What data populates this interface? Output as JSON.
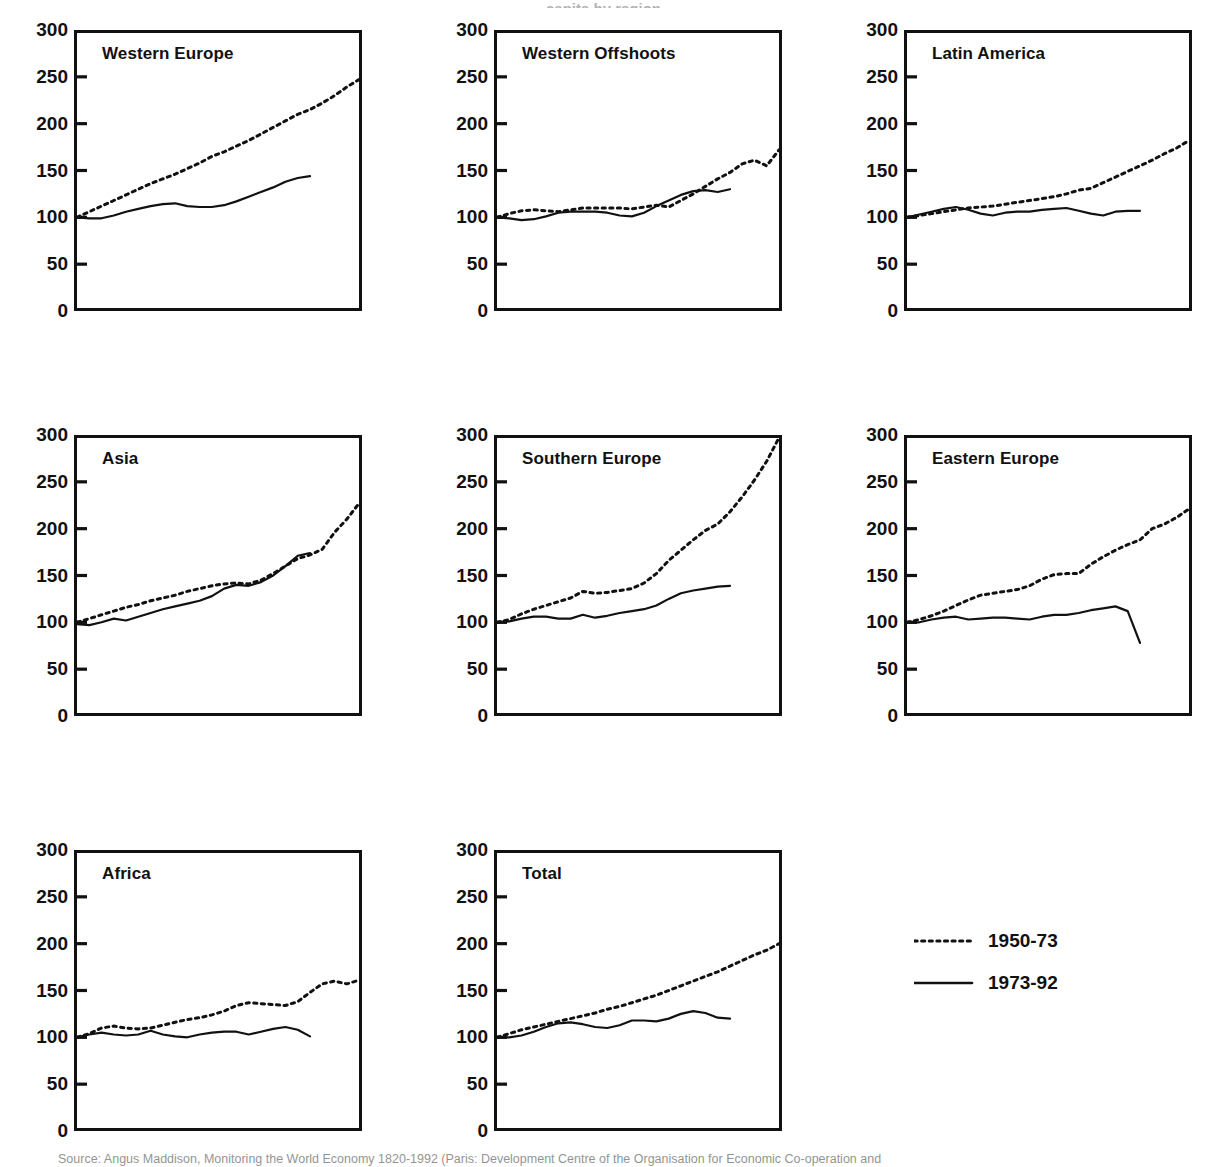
{
  "figure": {
    "top_title": "capita by region",
    "source": "Source: Angus Maddison, Monitoring the World Economy 1820-1992 (Paris: Development Centre of the Organisation for Economic Co-operation and"
  },
  "axis": {
    "yticks": [
      300,
      250,
      200,
      150,
      100,
      50,
      0
    ],
    "ymin": 0,
    "ymax": 300
  },
  "legend": {
    "position": "bottom-right",
    "entries": [
      {
        "label": "1950-73",
        "style": "dotted"
      },
      {
        "label": "1973-92",
        "style": "solid"
      }
    ]
  },
  "chart_data": {
    "type": "line",
    "xlabel": "",
    "ylabel": "Index (start year = 100)",
    "ylim": [
      0,
      300
    ],
    "yticks": [
      0,
      50,
      100,
      150,
      200,
      250,
      300
    ],
    "grid": false,
    "series_names": [
      "1950-73",
      "1973-92"
    ],
    "panels": [
      {
        "name": "Western Europe",
        "series": [
          {
            "name": "1950-73",
            "style": "dotted",
            "x": [
              0,
              1,
              2,
              3,
              4,
              5,
              6,
              7,
              8,
              9,
              10,
              11,
              12,
              13,
              14,
              15,
              16,
              17,
              18,
              19,
              20,
              21,
              22,
              23
            ],
            "values": [
              100,
              106,
              112,
              118,
              124,
              130,
              136,
              141,
              146,
              152,
              158,
              165,
              170,
              176,
              182,
              189,
              196,
              203,
              210,
              215,
              222,
              230,
              239,
              247
            ]
          },
          {
            "name": "1973-92",
            "style": "solid",
            "x": [
              0,
              1,
              2,
              3,
              4,
              5,
              6,
              7,
              8,
              9,
              10,
              11,
              12,
              13,
              14,
              15,
              16,
              17,
              18,
              19
            ],
            "values": [
              100,
              99,
              99,
              102,
              106,
              109,
              112,
              114,
              115,
              112,
              111,
              111,
              113,
              117,
              122,
              127,
              132,
              138,
              142,
              144
            ]
          }
        ]
      },
      {
        "name": "Western Offshoots",
        "series": [
          {
            "name": "1950-73",
            "style": "dotted",
            "x": [
              0,
              1,
              2,
              3,
              4,
              5,
              6,
              7,
              8,
              9,
              10,
              11,
              12,
              13,
              14,
              15,
              16,
              17,
              18,
              19,
              20,
              21,
              22,
              23
            ],
            "values": [
              100,
              104,
              107,
              108,
              107,
              106,
              108,
              110,
              110,
              110,
              110,
              109,
              111,
              113,
              111,
              118,
              125,
              133,
              141,
              148,
              157,
              161,
              155,
              172
            ]
          },
          {
            "name": "1973-92",
            "style": "solid",
            "x": [
              0,
              1,
              2,
              3,
              4,
              5,
              6,
              7,
              8,
              9,
              10,
              11,
              12,
              13,
              14,
              15,
              16,
              17,
              18,
              19
            ],
            "values": [
              100,
              99,
              97,
              98,
              101,
              105,
              106,
              106,
              106,
              105,
              102,
              101,
              105,
              112,
              118,
              124,
              128,
              129,
              127,
              130
            ]
          }
        ]
      },
      {
        "name": "Latin America",
        "series": [
          {
            "name": "1950-73",
            "style": "dotted",
            "x": [
              0,
              1,
              2,
              3,
              4,
              5,
              6,
              7,
              8,
              9,
              10,
              11,
              12,
              13,
              14,
              15,
              16,
              17,
              18,
              19,
              20,
              21,
              22,
              23
            ],
            "values": [
              100,
              102,
              104,
              106,
              108,
              110,
              111,
              112,
              114,
              116,
              118,
              120,
              122,
              125,
              129,
              131,
              137,
              143,
              149,
              155,
              161,
              168,
              174,
              182
            ]
          },
          {
            "name": "1973-92",
            "style": "solid",
            "x": [
              0,
              1,
              2,
              3,
              4,
              5,
              6,
              7,
              8,
              9,
              10,
              11,
              12,
              13,
              14,
              15,
              16,
              17,
              18,
              19
            ],
            "values": [
              100,
              103,
              106,
              109,
              111,
              108,
              104,
              102,
              105,
              106,
              106,
              108,
              109,
              110,
              107,
              104,
              102,
              106,
              107,
              107
            ]
          }
        ]
      },
      {
        "name": "Asia",
        "series": [
          {
            "name": "1950-73",
            "style": "dotted",
            "x": [
              0,
              1,
              2,
              3,
              4,
              5,
              6,
              7,
              8,
              9,
              10,
              11,
              12,
              13,
              14,
              15,
              16,
              17,
              18,
              19,
              20,
              21,
              22,
              23
            ],
            "values": [
              100,
              104,
              108,
              112,
              116,
              119,
              123,
              126,
              129,
              133,
              136,
              139,
              141,
              142,
              141,
              145,
              152,
              160,
              168,
              172,
              178,
              196,
              210,
              227
            ]
          },
          {
            "name": "1973-92",
            "style": "solid",
            "x": [
              0,
              1,
              2,
              3,
              4,
              5,
              6,
              7,
              8,
              9,
              10,
              11,
              12,
              13,
              14,
              15,
              16,
              17,
              18,
              19
            ],
            "values": [
              98,
              97,
              100,
              104,
              102,
              106,
              110,
              114,
              117,
              120,
              123,
              128,
              136,
              140,
              139,
              143,
              150,
              160,
              171,
              174
            ]
          }
        ]
      },
      {
        "name": "Southern Europe",
        "series": [
          {
            "name": "1950-73",
            "style": "dotted",
            "x": [
              0,
              1,
              2,
              3,
              4,
              5,
              6,
              7,
              8,
              9,
              10,
              11,
              12,
              13,
              14,
              15,
              16,
              17,
              18,
              19,
              20,
              21,
              22,
              23
            ],
            "values": [
              100,
              103,
              109,
              114,
              118,
              122,
              126,
              133,
              131,
              132,
              134,
              136,
              142,
              152,
              166,
              177,
              188,
              198,
              205,
              218,
              234,
              252,
              272,
              297
            ]
          },
          {
            "name": "1973-92",
            "style": "solid",
            "x": [
              0,
              1,
              2,
              3,
              4,
              5,
              6,
              7,
              8,
              9,
              10,
              11,
              12,
              13,
              14,
              15,
              16,
              17,
              18,
              19
            ],
            "values": [
              100,
              101,
              104,
              106,
              106,
              104,
              104,
              108,
              105,
              107,
              110,
              112,
              114,
              118,
              125,
              131,
              134,
              136,
              138,
              139
            ]
          }
        ]
      },
      {
        "name": "Eastern Europe",
        "series": [
          {
            "name": "1950-73",
            "style": "dotted",
            "x": [
              0,
              1,
              2,
              3,
              4,
              5,
              6,
              7,
              8,
              9,
              10,
              11,
              12,
              13,
              14,
              15,
              16,
              17,
              18,
              19,
              20,
              21,
              22,
              23
            ],
            "values": [
              100,
              103,
              107,
              112,
              118,
              124,
              129,
              131,
              133,
              135,
              139,
              146,
              151,
              152,
              152,
              162,
              170,
              177,
              183,
              188,
              200,
              205,
              212,
              221
            ]
          },
          {
            "name": "1973-92",
            "style": "solid",
            "x": [
              0,
              1,
              2,
              3,
              4,
              5,
              6,
              7,
              8,
              9,
              10,
              11,
              12,
              13,
              14,
              15,
              16,
              17,
              18,
              19
            ],
            "values": [
              100,
              100,
              103,
              105,
              106,
              103,
              104,
              105,
              105,
              104,
              103,
              106,
              108,
              108,
              110,
              113,
              115,
              117,
              112,
              78
            ]
          }
        ]
      },
      {
        "name": "Africa",
        "series": [
          {
            "name": "1950-73",
            "style": "dotted",
            "x": [
              0,
              1,
              2,
              3,
              4,
              5,
              6,
              7,
              8,
              9,
              10,
              11,
              12,
              13,
              14,
              15,
              16,
              17,
              18,
              19,
              20,
              21,
              22,
              23
            ],
            "values": [
              100,
              104,
              110,
              112,
              110,
              109,
              110,
              113,
              116,
              119,
              121,
              124,
              128,
              134,
              137,
              136,
              135,
              134,
              138,
              148,
              157,
              160,
              157,
              161
            ]
          },
          {
            "name": "1973-92",
            "style": "solid",
            "x": [
              0,
              1,
              2,
              3,
              4,
              5,
              6,
              7,
              8,
              9,
              10,
              11,
              12,
              13,
              14,
              15,
              16,
              17,
              18,
              19
            ],
            "values": [
              100,
              103,
              105,
              103,
              102,
              103,
              107,
              103,
              101,
              100,
              103,
              105,
              106,
              106,
              103,
              106,
              109,
              111,
              108,
              101
            ]
          }
        ]
      },
      {
        "name": "Total",
        "series": [
          {
            "name": "1950-73",
            "style": "dotted",
            "x": [
              0,
              1,
              2,
              3,
              4,
              5,
              6,
              7,
              8,
              9,
              10,
              11,
              12,
              13,
              14,
              15,
              16,
              17,
              18,
              19,
              20,
              21,
              22,
              23
            ],
            "values": [
              100,
              104,
              108,
              111,
              114,
              117,
              120,
              123,
              126,
              130,
              133,
              137,
              141,
              145,
              150,
              155,
              160,
              165,
              170,
              176,
              182,
              188,
              193,
              200
            ]
          },
          {
            "name": "1973-92",
            "style": "solid",
            "x": [
              0,
              1,
              2,
              3,
              4,
              5,
              6,
              7,
              8,
              9,
              10,
              11,
              12,
              13,
              14,
              15,
              16,
              17,
              18,
              19
            ],
            "values": [
              100,
              100,
              102,
              106,
              111,
              115,
              116,
              114,
              111,
              110,
              113,
              118,
              118,
              117,
              120,
              125,
              128,
              126,
              121,
              120
            ]
          }
        ]
      }
    ]
  }
}
